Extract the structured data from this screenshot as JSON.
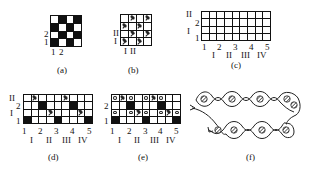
{
  "panels": {
    "a": {
      "caption": "(a)",
      "y_labels": [
        "2",
        "1"
      ],
      "x_labels": [
        "1",
        "2"
      ],
      "rows": 4,
      "cols": 4,
      "cells_top_to_bottom": [
        [
          "w",
          "b",
          "w",
          "b"
        ],
        [
          "b",
          "w",
          "b",
          "w"
        ],
        [
          "w",
          "b",
          "w",
          "b"
        ],
        [
          "b",
          "w",
          "b",
          "w"
        ]
      ]
    },
    "b": {
      "caption": "(b)",
      "y_labels": [
        "II",
        "I"
      ],
      "x_labels": [
        "I",
        "II"
      ],
      "rows": 4,
      "cols": 4,
      "cells_top_to_bottom": [
        [
          "w",
          "xo",
          "w",
          "xo"
        ],
        [
          "xo",
          "w",
          "xo",
          "w"
        ],
        [
          "w",
          "xo",
          "w",
          "xo"
        ],
        [
          "xo",
          "w",
          "xo",
          "w"
        ]
      ]
    },
    "c": {
      "caption": "(c)",
      "y_labels_outer": [
        "II",
        "I"
      ],
      "y_labels_inner": [
        "2",
        "1"
      ],
      "x_labels": [
        "1",
        "2",
        "3",
        "4",
        "5"
      ],
      "x_labels_roman": [
        "I",
        "II",
        "III",
        "IV"
      ],
      "rows": 4,
      "cols": 9
    },
    "d": {
      "caption": "(d)",
      "y_labels_outer": [
        "II",
        "I"
      ],
      "y_labels_inner": [
        "2",
        "1"
      ],
      "x_labels": [
        "1",
        "2",
        "3",
        "4",
        "5"
      ],
      "x_labels_roman": [
        "I",
        "II",
        "III",
        "IV"
      ],
      "rows": 4,
      "cols": 9,
      "cells_top_to_bottom": [
        [
          "w",
          "xo",
          "w",
          "w",
          "w",
          "xo",
          "w",
          "w",
          "w"
        ],
        [
          "w",
          "w",
          "b",
          "w",
          "w",
          "w",
          "b",
          "w",
          "w"
        ],
        [
          "w",
          "w",
          "w",
          "xo",
          "w",
          "w",
          "w",
          "xo",
          "w"
        ],
        [
          "b",
          "w",
          "w",
          "w",
          "b",
          "w",
          "w",
          "w",
          "b"
        ]
      ]
    },
    "e": {
      "caption": "(e)",
      "y_labels_inner": [
        "2",
        "1"
      ],
      "x_labels": [
        "1",
        "2",
        "3",
        "4",
        "5"
      ],
      "x_labels_roman": [
        "I",
        "II",
        "III",
        "IV"
      ],
      "rows": 4,
      "cols": 9,
      "cells_top_to_bottom": [
        [
          "o",
          "xo",
          "o",
          "w",
          "o",
          "xo",
          "o",
          "w",
          "w"
        ],
        [
          "w",
          "w",
          "b",
          "w",
          "w",
          "w",
          "b",
          "w",
          "w"
        ],
        [
          "o",
          "w",
          "o",
          "xo",
          "o",
          "w",
          "o",
          "xo",
          "o"
        ],
        [
          "b",
          "w",
          "w",
          "w",
          "b",
          "w",
          "w",
          "w",
          "b"
        ]
      ]
    },
    "f": {
      "caption": "(f)",
      "top_row_yarns": 5,
      "bottom_row_yarns": 4
    }
  }
}
